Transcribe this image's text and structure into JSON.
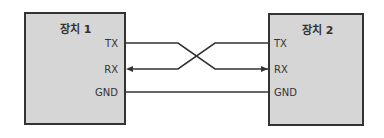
{
  "diagram": {
    "devices": [
      {
        "name": "장치 1",
        "pins": [
          "TX",
          "RX",
          "GND"
        ]
      },
      {
        "name": "장치 2",
        "pins": [
          "TX",
          "RX",
          "GND"
        ]
      }
    ],
    "connections": [
      {
        "from": "장치 1 TX",
        "to": "장치 2 RX",
        "direction": "to device 2"
      },
      {
        "from": "장치 2 TX",
        "to": "장치 1 RX",
        "direction": "to device 1"
      },
      {
        "from": "장치 1 GND",
        "to": "장치 2 GND",
        "direction": "none"
      }
    ],
    "colors": {
      "box_fill": "#d6d6d6",
      "line": "#333333"
    }
  }
}
